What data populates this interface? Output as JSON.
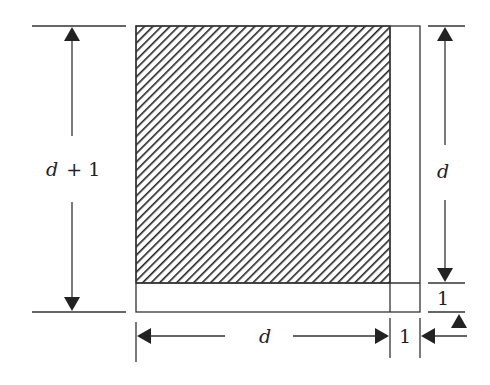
{
  "diagram": {
    "type": "square-decomposition",
    "colors": {
      "line": "#333333",
      "hatch": "#222222",
      "background": "#ffffff"
    },
    "regions": [
      {
        "name": "hatched-square",
        "size": "d × d",
        "hatched": true
      },
      {
        "name": "right-strip",
        "size": "1 × d",
        "hatched": false
      },
      {
        "name": "bottom-strip",
        "size": "d × 1",
        "hatched": false
      },
      {
        "name": "corner-square",
        "size": "1 × 1",
        "hatched": false
      }
    ],
    "labels": {
      "left_var": "d",
      "left_rest": "+ 1",
      "right_d": "d",
      "right_one": "1",
      "bottom_d": "d",
      "bottom_one": "1"
    }
  }
}
